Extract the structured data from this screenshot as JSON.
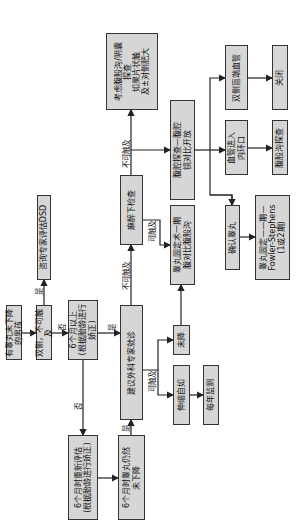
{
  "diagram": {
    "title": "",
    "nodes": {
      "start": "有睾丸未下降的男孩",
      "bilateral": "双侧，不可触及",
      "dsd": "咨询专家评估DSD",
      "over6m": "6个月以上\n(根据胎龄进行矫正)",
      "reassess": "6个月时重新评估\n(根据胎龄进行矫正)",
      "still_undescended": "6个月时睾丸仍然\n未下降",
      "refer": "建议外科专家就诊",
      "eua": "麻醉下检查",
      "orchidopexy_groin": "睾丸固定术一期\n腹对比腹股沟",
      "undescended": "未降",
      "retractile": "伸缩自如",
      "annual": "每年监测",
      "laparoscopy": "腹腔探查—腹腔\n镜对比开放",
      "inguinal_scrotal": "考虑腹股沟/阴囊\n探查\n如果片状触\n及±对侧肥大",
      "confirm_testis": "确认睾丸",
      "fowler": "睾丸固定——期—\nFowler-Stephens\n(1或2期)",
      "vessels_ring": "血管进入\n内环口",
      "groin_explore": "腹股沟探查",
      "blind_vessels": "双侧盲端血管",
      "close": "关闭"
    },
    "edge_labels": {
      "yes1": "是",
      "no1": "否",
      "no2": "否",
      "yes2": "是",
      "yes3": "是",
      "nonpalp1": "不可触及",
      "nonpalp2": "不可触及",
      "palp1": "可触及",
      "palp2": "可触及"
    },
    "colors": {
      "box_fill": "#d6d6d6",
      "box_border": "#333333",
      "line": "#222222"
    }
  }
}
